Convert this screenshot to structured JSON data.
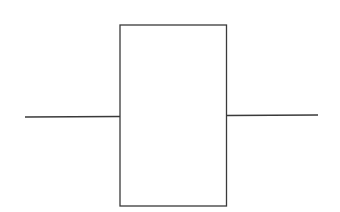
{
  "diagram": {
    "type": "block-with-terminals",
    "stroke_color": "#3a3a3a",
    "background": "#ffffff",
    "block": {
      "x": 120,
      "y": 25,
      "width": 106.5,
      "height": 181
    },
    "left_lead": {
      "x1": 25,
      "y1": 117,
      "x2": 120,
      "y2": 116.5
    },
    "right_lead": {
      "x1": 226.5,
      "y1": 115.5,
      "x2": 318,
      "y2": 115
    }
  }
}
